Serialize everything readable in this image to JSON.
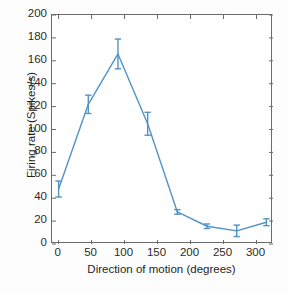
{
  "chart_data": {
    "type": "line",
    "title": "",
    "subtitle": "",
    "xlabel": "Direction of motion (degrees)",
    "ylabel": "Firing rate (Spikes/s)",
    "x": [
      0,
      45,
      90,
      135,
      180,
      225,
      270,
      315
    ],
    "values": [
      48,
      122,
      166,
      105,
      28,
      15.5,
      11.5,
      19
    ],
    "error_bars": [
      7,
      8,
      13,
      10,
      2,
      2,
      5,
      3
    ],
    "series": [
      {
        "name": "Firing rate",
        "x": [
          0,
          45,
          90,
          135,
          180,
          225,
          270,
          315
        ],
        "values": [
          48,
          122,
          166,
          105,
          28,
          15.5,
          11.5,
          19
        ],
        "errors": [
          7,
          8,
          13,
          10,
          2,
          2,
          5,
          3
        ],
        "color": "#5293c6"
      }
    ],
    "xlim": [
      -10,
      325
    ],
    "ylim": [
      0,
      200
    ],
    "xticks": [
      0,
      50,
      100,
      150,
      200,
      250,
      300
    ],
    "xtick_labels": [
      "0",
      "50",
      "100",
      "150",
      "200",
      "250",
      "300"
    ],
    "yticks": [
      0,
      20,
      40,
      60,
      80,
      100,
      120,
      140,
      160,
      180,
      200
    ],
    "ytick_labels": [
      "0",
      "20",
      "40",
      "60",
      "80",
      "100",
      "120",
      "140",
      "160",
      "180",
      "200"
    ],
    "grid": false,
    "legend": "none",
    "marker": "none",
    "line_width": 1.4,
    "annotations": []
  },
  "style": {
    "line_color": "#5293c6",
    "axis_color": "#6b6b6b",
    "text_color": "#1f1f1f",
    "background": "#ffffff"
  }
}
